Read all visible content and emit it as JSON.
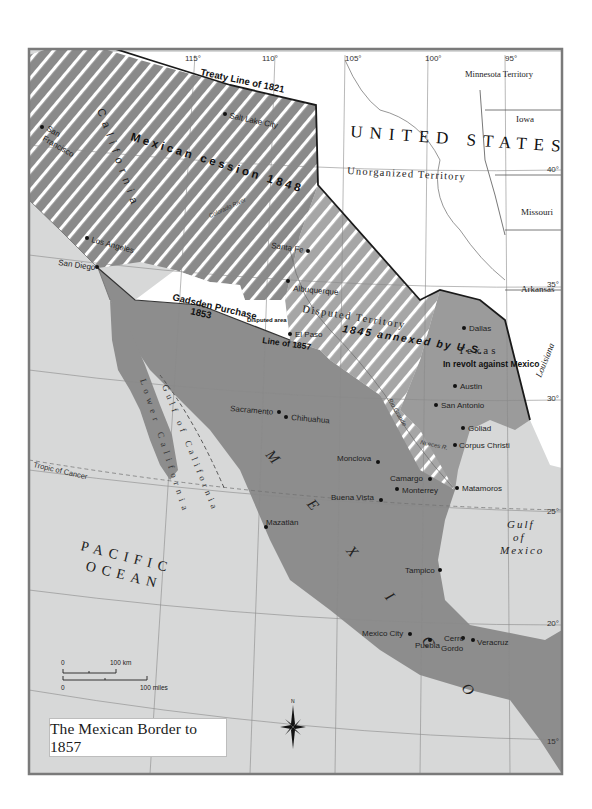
{
  "map": {
    "title": "The Mexican Border to 1857",
    "colors": {
      "sea": "#d7d8d8",
      "mexico": "#8d8d8d",
      "texas": "#9b9b9b",
      "us_land": "#ffffff",
      "hatch_dark": "#8a8a8a",
      "hatch_light": "#ffffff",
      "border_line": "#1a1a1a",
      "frame": "#7a7a7a"
    },
    "longitudes": [
      "115°",
      "110°",
      "105°",
      "100°",
      "95°"
    ],
    "latitudes": [
      "40°",
      "35°",
      "30°",
      "25°",
      "20°",
      "15°"
    ],
    "lines": {
      "treaty_1821": "Treaty Line of 1821",
      "line_1857": "Line of 1857",
      "tropic": "Tropic of Cancer"
    },
    "regions": {
      "united_states": "UNITED STATES",
      "unorganized": "Unorganized Territory",
      "minnesota": "Minnesota Territory",
      "iowa": "Iowa",
      "missouri": "Missouri",
      "arkansas": "Arkansas",
      "louisiana": "Louisiana",
      "california": "California",
      "mexican_cession": "Mexican cession 1848",
      "gadsden_line1": "Gadsden Purchase",
      "gadsden_line2": "1853",
      "disputed_area": "Disputed area",
      "disputed_territory": "Disputed Territory",
      "annexed": "1845 annexed by U.S.",
      "texas": "Texas",
      "texas_revolt": "In revolt against Mexico",
      "mexico": "M E X I C O",
      "lower_california": "Lower California",
      "gulf_california": "Gulf of California",
      "pacific_1": "PACIFIC",
      "pacific_2": "OCEAN",
      "gulf_mexico_1": "Gulf",
      "gulf_mexico_2": "of",
      "gulf_mexico_3": "Mexico"
    },
    "rivers": {
      "colorado": "Colorado River",
      "rio_grande": "Rio Grande",
      "nueces": "Nueces R."
    },
    "cities": [
      {
        "name": "San Francisco",
        "line1": "San",
        "line2": "Francisco"
      },
      {
        "name": "Salt Lake City"
      },
      {
        "name": "Los Angeles"
      },
      {
        "name": "San Diego"
      },
      {
        "name": "Santa Fe"
      },
      {
        "name": "Albuquerque"
      },
      {
        "name": "El Paso"
      },
      {
        "name": "Dallas"
      },
      {
        "name": "Austin"
      },
      {
        "name": "San Antonio"
      },
      {
        "name": "Goliad"
      },
      {
        "name": "Corpus Christi"
      },
      {
        "name": "Sacramento"
      },
      {
        "name": "Chihuahua"
      },
      {
        "name": "Monclova"
      },
      {
        "name": "Camargo"
      },
      {
        "name": "Monterrey"
      },
      {
        "name": "Buena Vista"
      },
      {
        "name": "Matamoros"
      },
      {
        "name": "Mazatlán"
      },
      {
        "name": "Tampico"
      },
      {
        "name": "Mexico City"
      },
      {
        "name": "Puebla"
      },
      {
        "name": "Cerro Gordo",
        "line1": "Cerro",
        "line2": "Gordo"
      },
      {
        "name": "Veracruz"
      }
    ],
    "scale": {
      "km_zero": "0",
      "km_label": "100 km",
      "mi_zero": "0",
      "mi_label": "100 miles"
    },
    "compass": {
      "north": "N"
    }
  }
}
